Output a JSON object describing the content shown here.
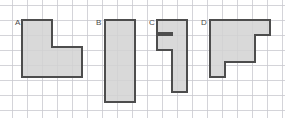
{
  "figure": {
    "type": "grid-polyomino-worksheet",
    "background_color": "#ffffff",
    "grid": {
      "cell_size_px": 15,
      "origin_x_px": 12,
      "origin_y_px": 5,
      "columns": 18,
      "rows": 7,
      "line_color": "#c9c9cf",
      "line_width_px": 0.8,
      "visible": true
    },
    "shape_style": {
      "fill_color": "#d2d2d2",
      "stroke_color": "#4d4d4d",
      "stroke_width_px": 2,
      "fill_opacity": 0.85
    },
    "shapes": [
      {
        "label": "A",
        "label_x_px": 15,
        "label_y_px": 25,
        "description": "L-shape, 4x4 bounding box with 2x2 notch removed from top-right",
        "area_cells": 12,
        "perimeter_cells": 16,
        "bounding_box_cells": [
          4,
          4
        ],
        "points_px": "22,20 52,20 52,47 82,47 82,77 22,77"
      },
      {
        "label": "B",
        "label_x_px": 96,
        "label_y_px": 25,
        "description": "Rectangle, 2 wide by 7 tall",
        "area_cells": 14,
        "perimeter_cells": 18,
        "bounding_box_cells": [
          2,
          7
        ],
        "points_px": "105,20 135,20 135,102 105,102"
      },
      {
        "label": "C",
        "label_x_px": 149,
        "label_y_px": 25,
        "description": "Vertical bar with a 1x1 notch cut into the left edge near the top",
        "area_cells": 10,
        "perimeter_cells": 22,
        "bounding_box_cells": [
          2,
          5
        ],
        "points_px": "157,20 187,20 187,92 172,92 172,50 157,50 157,35 172,35 172,33 157,33"
      },
      {
        "label": "D",
        "label_x_px": 201,
        "label_y_px": 25,
        "description": "Staircase: 4x4 block with descending steps cut from the right side",
        "area_cells": 13,
        "perimeter_cells": 18,
        "bounding_box_cells": [
          4,
          4
        ],
        "points_px": "210,20 270,20 270,35 255,35 255,62 225,62 225,77 210,77"
      }
    ]
  }
}
